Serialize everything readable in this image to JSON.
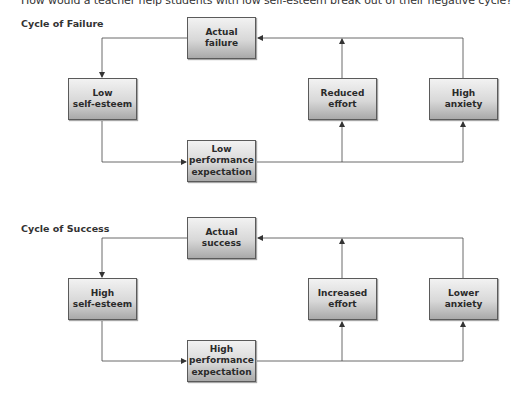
{
  "caption": "How would a teacher help students with low self-esteem break out of their negative cycle?",
  "cycles": [
    {
      "title": "Cycle of Failure",
      "nodes": {
        "actual": [
          "Actual",
          "failure"
        ],
        "self_esteem": [
          "Low",
          "self-esteem"
        ],
        "expectation": [
          "Low",
          "performance",
          "expectation"
        ],
        "effort": [
          "Reduced",
          "effort"
        ],
        "anxiety": [
          "High",
          "anxiety"
        ]
      }
    },
    {
      "title": "Cycle of Success",
      "nodes": {
        "actual": [
          "Actual",
          "success"
        ],
        "self_esteem": [
          "High",
          "self-esteem"
        ],
        "expectation": [
          "High",
          "performance",
          "expectation"
        ],
        "effort": [
          "Increased",
          "effort"
        ],
        "anxiety": [
          "Lower",
          "anxiety"
        ]
      }
    }
  ],
  "colors": {
    "line": "#444444",
    "box_border": "#5a5a5a",
    "box_top": "#f2f2f2",
    "box_bottom": "#a9a9a9"
  }
}
